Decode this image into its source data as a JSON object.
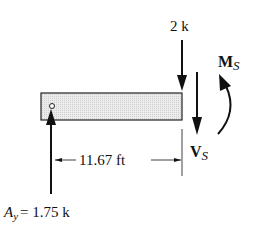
{
  "diagram": {
    "type": "free-body-diagram",
    "beam": {
      "fill": "#e4e4e4",
      "stroke": "#222222"
    },
    "load": {
      "value": "2 k"
    },
    "moment": {
      "symbol": "M",
      "subscript": "S"
    },
    "shear": {
      "symbol": "V",
      "subscript": "S"
    },
    "dimension": {
      "value": "11.67 ft"
    },
    "reaction": {
      "symbol": "A",
      "subscript": "y",
      "value": "= 1.75 k"
    }
  }
}
